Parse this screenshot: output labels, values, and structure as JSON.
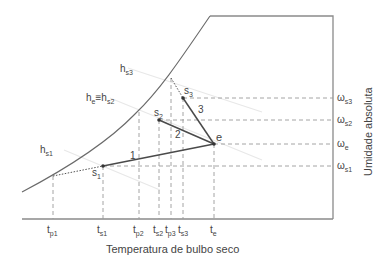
{
  "axes": {
    "xlabel": "Temperatura de bulbo seco",
    "ylabel": "Umidade absoluta"
  },
  "x_ticks": [
    {
      "id": "tp1",
      "base": "t",
      "sub": "p1",
      "x": 53
    },
    {
      "id": "ts1",
      "base": "t",
      "sub": "s1",
      "x": 103
    },
    {
      "id": "tp2",
      "base": "t",
      "sub": "p2",
      "x": 139
    },
    {
      "id": "ts2",
      "base": "t",
      "sub": "s2",
      "x": 159
    },
    {
      "id": "tp3",
      "base": "t",
      "sub": "p3",
      "x": 171
    },
    {
      "id": "ts3",
      "base": "t",
      "sub": "s3",
      "x": 183
    },
    {
      "id": "te",
      "base": "t",
      "sub": "e",
      "x": 214
    }
  ],
  "y_ticks": [
    {
      "id": "ws3",
      "base": "ω",
      "sub": "s3",
      "y": 98
    },
    {
      "id": "ws2",
      "base": "ω",
      "sub": "s2",
      "y": 120
    },
    {
      "id": "we",
      "base": "ω",
      "sub": "e",
      "y": 144
    },
    {
      "id": "ws1",
      "base": "ω",
      "sub": "s1",
      "y": 166
    }
  ],
  "points": {
    "e": {
      "label": "e",
      "x": 214,
      "y": 144
    },
    "s1": {
      "label": "s",
      "sub": "1",
      "x": 103,
      "y": 166
    },
    "s2": {
      "label": "s",
      "sub": "2",
      "x": 159,
      "y": 120
    },
    "s3": {
      "label": "s",
      "sub": "3",
      "x": 183,
      "y": 98
    }
  },
  "process_labels": [
    {
      "text": "1",
      "x": 133,
      "y": 160
    },
    {
      "text": "2",
      "x": 178,
      "y": 137
    },
    {
      "text": "3",
      "x": 202,
      "y": 112
    }
  ],
  "enthalpy_labels": {
    "hs3": {
      "base": "h",
      "sub": "s3"
    },
    "he_hs2": {
      "base": "h",
      "sub1": "e",
      "eq": "≡",
      "base2": "h",
      "sub2": "s2"
    },
    "hs1": {
      "base": "h",
      "sub": "s1"
    }
  },
  "colors": {
    "axis": "#8a8a8a",
    "curve": "#6a6a6a",
    "process": "#4a4a4a",
    "dashed": "#9a9a9a",
    "enthalpy": "#e6e6e6",
    "text": "#444444"
  }
}
